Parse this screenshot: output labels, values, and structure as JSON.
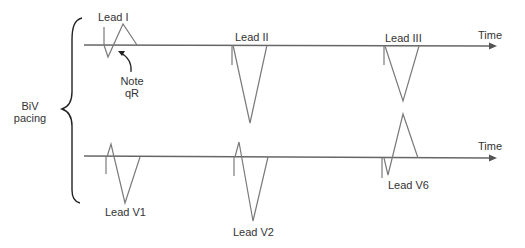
{
  "diagram": {
    "group_label_line1": "BiV",
    "group_label_line2": "pacing",
    "axis_label_top": "Time",
    "axis_label_bottom": "Time",
    "annotation_line1": "Note",
    "annotation_line2": "qR",
    "leads": {
      "lead_i": "Lead I",
      "lead_ii": "Lead II",
      "lead_iii": "Lead III",
      "lead_v1": "Lead V1",
      "lead_v2": "Lead V2",
      "lead_v6": "Lead V6"
    },
    "colors": {
      "trace": "#7a7a7a",
      "axis": "#666666",
      "text": "#333333"
    }
  }
}
